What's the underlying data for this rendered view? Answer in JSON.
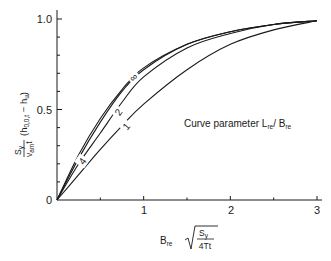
{
  "chart_data": {
    "type": "line",
    "title": "",
    "xlabel": "B_re √(S_y / 4Tt)",
    "ylabel": "S_y / (v_am t) (h_0,0,t − h_u)",
    "xlim": [
      0,
      3
    ],
    "ylim": [
      0,
      1.0
    ],
    "grid": false,
    "x_ticks": [
      0.5,
      1,
      1.5,
      2,
      2.5,
      3
    ],
    "x_tick_labels": [
      "1",
      "2",
      "3"
    ],
    "y_ticks": [
      0,
      0.1,
      0.2,
      0.3,
      0.4,
      0.5,
      0.6,
      0.7,
      0.8,
      0.9,
      1.0
    ],
    "y_tick_labels": [
      "0",
      "0.5",
      "1.0"
    ],
    "annotation": "Curve parameter L_re / B_re",
    "series": [
      {
        "name": "∞",
        "x": [
          0,
          0.25,
          0.5,
          0.75,
          1.0,
          1.5,
          2.0,
          2.5,
          3.0
        ],
        "values": [
          0,
          0.25,
          0.45,
          0.61,
          0.73,
          0.86,
          0.93,
          0.97,
          0.99
        ]
      },
      {
        "name": "4",
        "x": [
          0,
          0.25,
          0.5,
          0.75,
          1.0,
          1.5,
          2.0,
          2.5,
          3.0
        ],
        "values": [
          0,
          0.23,
          0.43,
          0.6,
          0.72,
          0.86,
          0.93,
          0.97,
          0.99
        ]
      },
      {
        "name": "2",
        "x": [
          0,
          0.25,
          0.5,
          0.75,
          1.0,
          1.5,
          2.0,
          2.5,
          3.0
        ],
        "values": [
          0,
          0.2,
          0.37,
          0.54,
          0.68,
          0.84,
          0.92,
          0.97,
          0.99
        ]
      },
      {
        "name": "1",
        "x": [
          0,
          0.25,
          0.5,
          0.75,
          1.0,
          1.5,
          2.0,
          2.5,
          3.0
        ],
        "values": [
          0,
          0.14,
          0.28,
          0.41,
          0.53,
          0.72,
          0.86,
          0.94,
          0.99
        ]
      }
    ]
  },
  "axes": {
    "y_labels": {
      "zero": "0",
      "half": "0.5",
      "one": "1.0"
    },
    "x_labels": {
      "one": "1",
      "two": "2",
      "three": "3"
    },
    "xlabel_main": "B",
    "xlabel_sub": "re",
    "xlabel_num": "S",
    "xlabel_num_sub": "y",
    "xlabel_den": "4Tt",
    "ylabel_num": "S",
    "ylabel_num_sub": "y",
    "ylabel_den": "v",
    "ylabel_den_sub": "am",
    "ylabel_den_t": "t",
    "ylabel_paren": "(h",
    "ylabel_paren_sub": "0,0,t",
    "ylabel_minus": " − h",
    "ylabel_u": "u",
    "ylabel_close": ")"
  },
  "legend": {
    "prefix": "Curve parameter L",
    "sub1": "re",
    "mid": "/ B",
    "sub2": "re"
  },
  "curve_labels": {
    "inf": "∞",
    "four": "4",
    "two": "2",
    "one": "1"
  }
}
